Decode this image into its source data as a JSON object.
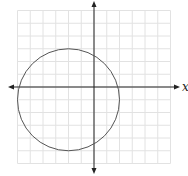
{
  "diagram": {
    "type": "coordinate-plane",
    "axis_labels": {
      "x": "x"
    },
    "grid": {
      "x_min": -6,
      "x_max": 6,
      "y_min": -6,
      "y_max": 6,
      "step": 1
    },
    "circle": {
      "center": [
        -2,
        -1
      ],
      "radius": 4
    },
    "colors": {
      "grid": "#e2e2e2",
      "axis": "#222222",
      "circle": "#555555"
    }
  }
}
